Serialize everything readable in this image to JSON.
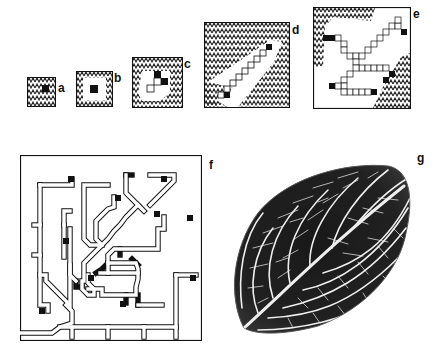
{
  "figure": {
    "colors": {
      "background": "#ffffff",
      "ink": "#111111",
      "hatch": "#222222",
      "cell_fill": "#ffffff",
      "active_cell": "#111111",
      "leaf_dark": "#1c1c1c",
      "leaf_vein": "#f2f2f2"
    },
    "panels": [
      {
        "id": "a",
        "label": "a",
        "kind": "grid-stage"
      },
      {
        "id": "b",
        "label": "b",
        "kind": "grid-stage"
      },
      {
        "id": "c",
        "label": "c",
        "kind": "grid-stage"
      },
      {
        "id": "d",
        "label": "d",
        "kind": "grid-stage"
      },
      {
        "id": "e",
        "label": "e",
        "kind": "grid-stage"
      },
      {
        "id": "f",
        "label": "f",
        "kind": "grid-network"
      },
      {
        "id": "g",
        "label": "g",
        "kind": "leaf-photo"
      }
    ]
  }
}
